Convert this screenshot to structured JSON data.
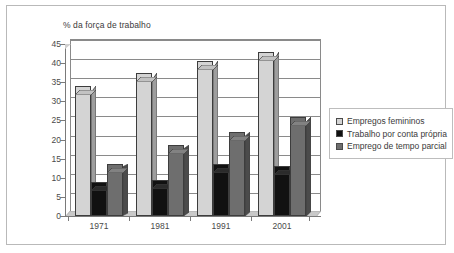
{
  "chart_data": {
    "type": "bar",
    "title": "% da força de trabalho",
    "xlabel": "",
    "ylabel": "",
    "ylim": [
      0,
      45
    ],
    "yticks": [
      0,
      5,
      10,
      15,
      20,
      25,
      30,
      35,
      40,
      45
    ],
    "grid": true,
    "legend_position": "right",
    "categories": [
      "1971",
      "1981",
      "1991",
      "2001"
    ],
    "series": [
      {
        "name": "Empregos femininos",
        "color": "#d4d4d4",
        "values": [
          34,
          37.5,
          40.5,
          43
        ]
      },
      {
        "name": "Trabalho por conta própria",
        "color": "#111111",
        "values": [
          9,
          9.5,
          13.5,
          13
        ]
      },
      {
        "name": "Emprego de tempo parcial",
        "color": "#6e6e6e",
        "values": [
          13.5,
          18.5,
          22,
          26
        ]
      }
    ]
  },
  "legend": {
    "items": [
      {
        "label": "Empregos femininos",
        "color": "#d4d4d4"
      },
      {
        "label": "Trabalho por conta própria",
        "color": "#111111"
      },
      {
        "label": "Emprego de tempo parcial",
        "color": "#6e6e6e"
      }
    ]
  },
  "colors": {
    "light_bar": "#d4d4d4",
    "light_bar_side": "#9e9e9e",
    "light_bar_top": "#bdbdbd",
    "black_bar": "#111111",
    "black_bar_side": "#ararar",
    "gray_bar": "#6e6e6e",
    "gray_bar_side": "#4f4f4f",
    "gray_bar_top": "#5e5e5e",
    "axis": "#7a7a7a",
    "grid": "#8a8a8a",
    "text": "#3a3a3a",
    "border": "#b9b9b9"
  }
}
